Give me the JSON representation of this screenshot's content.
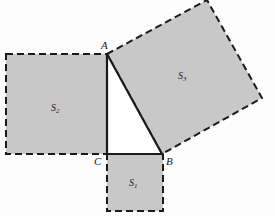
{
  "figure": {
    "colors": {
      "square_fill": "#c8c8c8",
      "stroke": "#1a1a1a",
      "background": "#fdfdfd"
    },
    "vertices": [
      {
        "name": "A",
        "label": "A"
      },
      {
        "name": "B",
        "label": "B"
      },
      {
        "name": "C",
        "label": "C"
      }
    ],
    "squares": [
      {
        "name": "S1",
        "label": "S",
        "subscript": "1",
        "side": "CB"
      },
      {
        "name": "S2",
        "label": "S",
        "subscript": "2",
        "side": "AC"
      },
      {
        "name": "S3",
        "label": "S",
        "subscript": "3",
        "side": "AB"
      }
    ]
  }
}
